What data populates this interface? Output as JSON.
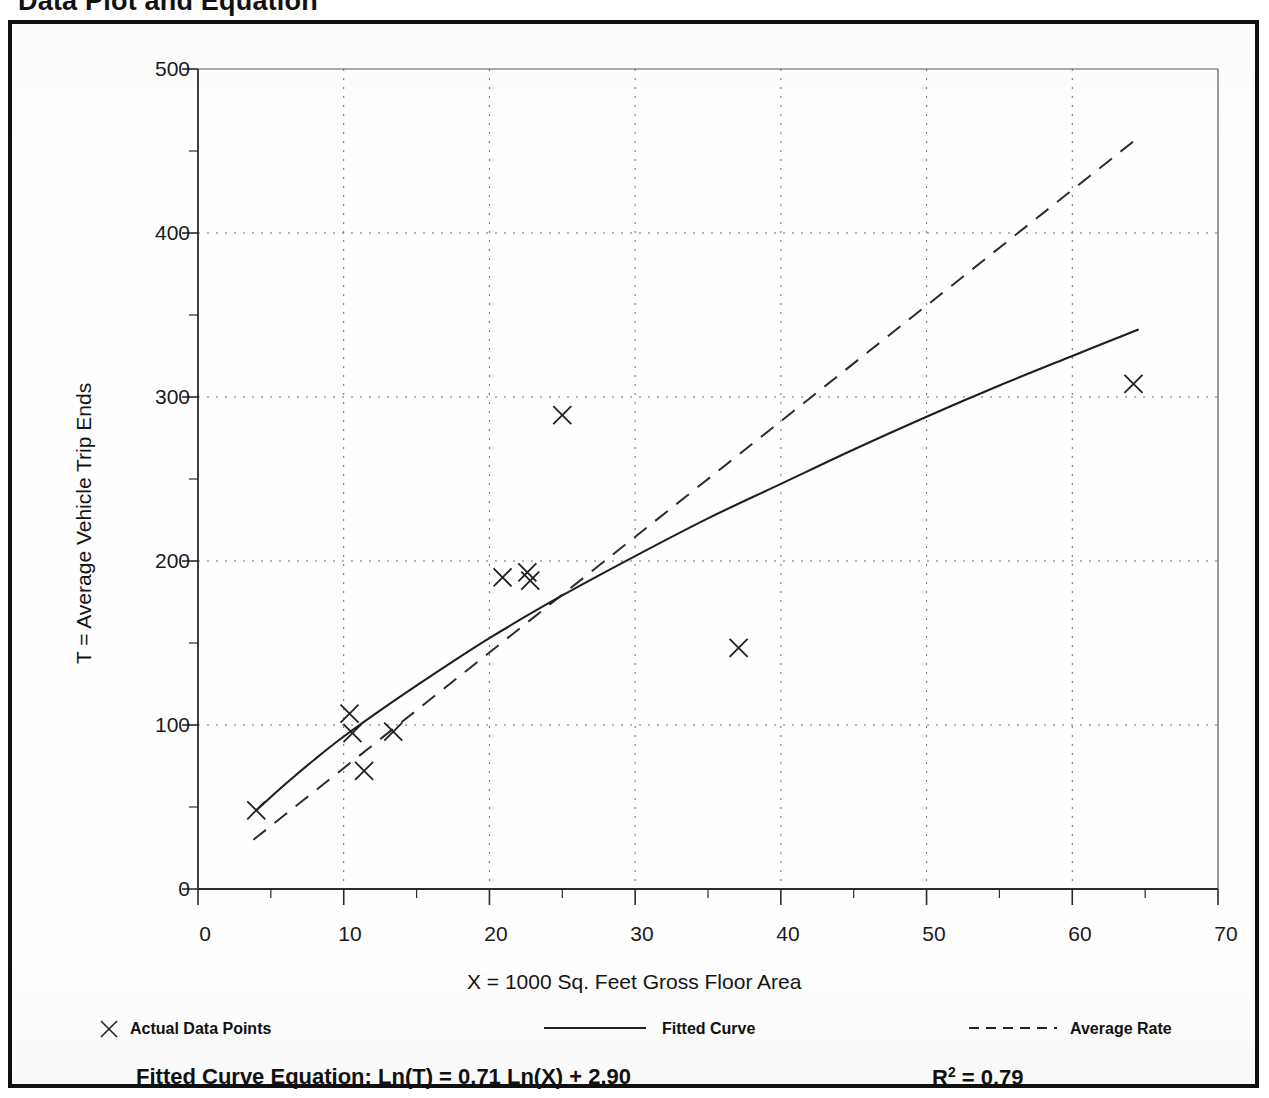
{
  "page": {
    "title": "Data Plot and Equation",
    "background_color": "#ffffff",
    "frame_color": "#101010"
  },
  "chart_data": {
    "type": "scatter",
    "title": "Data Plot and Equation",
    "xlabel": "X = 1000 Sq. Feet Gross Floor Area",
    "ylabel": "T = Average Vehicle Trip Ends",
    "xlim": [
      0,
      70
    ],
    "ylim": [
      0,
      500
    ],
    "xticks": [
      0,
      10,
      20,
      30,
      40,
      50,
      60,
      70
    ],
    "yticks": [
      0,
      100,
      200,
      300,
      400,
      500
    ],
    "x_minor_tick_step": 5,
    "y_minor_tick_step": 50,
    "grid": "dotted",
    "legend_position": "below-axes",
    "series": [
      {
        "name": "Actual Data Points",
        "type": "scatter",
        "marker": "x",
        "points": [
          {
            "x": 4.0,
            "y": 48
          },
          {
            "x": 10.4,
            "y": 107
          },
          {
            "x": 10.6,
            "y": 95
          },
          {
            "x": 11.4,
            "y": 72
          },
          {
            "x": 13.4,
            "y": 96
          },
          {
            "x": 20.9,
            "y": 190
          },
          {
            "x": 22.6,
            "y": 193
          },
          {
            "x": 22.8,
            "y": 188
          },
          {
            "x": 25.0,
            "y": 289
          },
          {
            "x": 37.1,
            "y": 147
          },
          {
            "x": 64.2,
            "y": 308
          }
        ]
      },
      {
        "name": "Fitted Curve",
        "type": "line",
        "style": "solid",
        "equation": "Ln(T) = 0.71 Ln(X) + 2.90",
        "points": [
          {
            "x": 4.0,
            "y": 48
          },
          {
            "x": 6.0,
            "y": 64
          },
          {
            "x": 8.0,
            "y": 79
          },
          {
            "x": 10.0,
            "y": 93
          },
          {
            "x": 13.0,
            "y": 112
          },
          {
            "x": 16.0,
            "y": 130
          },
          {
            "x": 20.0,
            "y": 153
          },
          {
            "x": 25.0,
            "y": 179
          },
          {
            "x": 30.0,
            "y": 203
          },
          {
            "x": 35.0,
            "y": 226
          },
          {
            "x": 40.0,
            "y": 247
          },
          {
            "x": 45.0,
            "y": 268
          },
          {
            "x": 50.0,
            "y": 288
          },
          {
            "x": 55.0,
            "y": 307
          },
          {
            "x": 60.0,
            "y": 325
          },
          {
            "x": 64.5,
            "y": 341
          }
        ]
      },
      {
        "name": "Average Rate",
        "type": "line",
        "style": "dashed",
        "points": [
          {
            "x": 3.8,
            "y": 30
          },
          {
            "x": 64.5,
            "y": 458
          }
        ]
      }
    ],
    "annotations": [
      {
        "name": "fitted-curve-equation",
        "text": "Fitted Curve Equation:  Ln(T) = 0.71 Ln(X) + 2.90"
      },
      {
        "name": "r-squared",
        "text": "R2 = 0.79",
        "value": 0.79
      }
    ]
  },
  "axes": {
    "y_title": "T = Average Vehicle Trip Ends",
    "x_title": "X = 1000 Sq. Feet Gross Floor Area",
    "y_tick_labels": [
      "500",
      "400",
      "300",
      "200",
      "100",
      "0"
    ],
    "x_tick_labels": [
      "0",
      "10",
      "20",
      "30",
      "40",
      "50",
      "60",
      "70"
    ]
  },
  "legend": {
    "items": [
      {
        "label": "Actual Data Points",
        "marker": "x-marker"
      },
      {
        "label": "Fitted Curve",
        "marker": "solid-line"
      },
      {
        "label": "Average Rate",
        "marker": "dashed-line"
      }
    ]
  },
  "equation": {
    "label": "Fitted Curve Equation:",
    "formula": "Ln(T) = 0.71 Ln(X) + 2.90",
    "full": "Fitted Curve Equation:  Ln(T) = 0.71 Ln(X) + 2.90",
    "r_squared_symbol": "R",
    "r_squared_exponent": "2",
    "r_squared_value": "= 0.79"
  }
}
